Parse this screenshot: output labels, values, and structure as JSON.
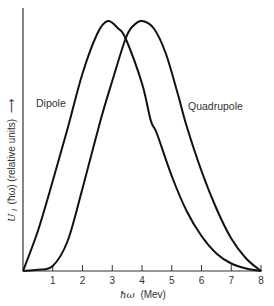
{
  "chart_data": {
    "type": "line",
    "title": "",
    "xlabel": "ħω (Mev)",
    "ylabel": "U_l (ħω) (relative units)",
    "ylabel_arrow": "→",
    "xlim": [
      0,
      8
    ],
    "ylim": [
      0,
      1
    ],
    "x_ticks": [
      1,
      2,
      3,
      4,
      5,
      6,
      7,
      8
    ],
    "x_tick_labels": [
      "1",
      "2",
      "3",
      "4",
      "5",
      "6",
      "7",
      "8"
    ],
    "y_ticks": [],
    "grid": false,
    "legend": "inline labels",
    "series": [
      {
        "name": "Dipole",
        "label_pos": {
          "x": 0.45,
          "y": 0.66
        },
        "points": [
          [
            0.0,
            0.0
          ],
          [
            0.5,
            0.16
          ],
          [
            1.0,
            0.36
          ],
          [
            1.5,
            0.57
          ],
          [
            2.0,
            0.79
          ],
          [
            2.5,
            0.95
          ],
          [
            2.85,
            1.0
          ],
          [
            3.2,
            0.97
          ],
          [
            3.45,
            0.93
          ],
          [
            4.0,
            0.75
          ],
          [
            4.3,
            0.6
          ],
          [
            4.5,
            0.55
          ],
          [
            5.0,
            0.38
          ],
          [
            5.5,
            0.24
          ],
          [
            6.0,
            0.14
          ],
          [
            6.5,
            0.07
          ],
          [
            7.0,
            0.03
          ],
          [
            7.5,
            0.01
          ],
          [
            8.0,
            0.0
          ]
        ]
      },
      {
        "name": "Quadrupole",
        "label_pos": {
          "x": 6.1,
          "y": 0.66
        },
        "points": [
          [
            0.0,
            0.0
          ],
          [
            0.5,
            0.005
          ],
          [
            1.0,
            0.02
          ],
          [
            1.5,
            0.12
          ],
          [
            2.0,
            0.33
          ],
          [
            2.6,
            0.6
          ],
          [
            3.0,
            0.76
          ],
          [
            3.45,
            0.93
          ],
          [
            3.7,
            0.98
          ],
          [
            4.0,
            1.0
          ],
          [
            4.4,
            0.97
          ],
          [
            4.8,
            0.87
          ],
          [
            5.2,
            0.71
          ],
          [
            5.5,
            0.58
          ],
          [
            6.0,
            0.4
          ],
          [
            6.5,
            0.25
          ],
          [
            7.0,
            0.13
          ],
          [
            7.5,
            0.05
          ],
          [
            8.0,
            0.0
          ]
        ]
      }
    ],
    "annotations": {
      "peak_dipole_mev": 2.85,
      "peak_quadrupole_mev": 4.0,
      "crossing_mev": 3.45
    }
  },
  "labels": {
    "dipole": "Dipole",
    "quadrupole": "Quadrupole",
    "xlabel_hbar_omega": "ħω",
    "xlabel_unit": "(Mev)",
    "ylabel_U": "U",
    "ylabel_sub": "l",
    "ylabel_rest": "(ħω) (relative units)",
    "ylabel_arrow": "⟶"
  },
  "colors": {
    "curve": "#111111",
    "axis": "#333333",
    "text": "#333333"
  }
}
